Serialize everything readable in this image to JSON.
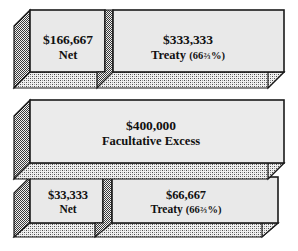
{
  "figure": {
    "name": "reinsurance-layer-diagram",
    "type": "layered-block-diagram",
    "orientation": "stacked-horizontal-bands",
    "colors": {
      "face_fill": "#e9e9e9",
      "face_fill_mid": "#ebebeb",
      "outline": "#1a1a1a",
      "extrusion_dither": "#7d7d7d",
      "shadow_dither": "#a8a8a8",
      "background": "#ffffff",
      "text": "#111111"
    }
  },
  "layers": [
    {
      "id": "top",
      "name": "top-layer",
      "blocks": [
        {
          "id": "top-net",
          "name": "top-net-block",
          "amount": "$166,667",
          "caption": "Net",
          "percent": null,
          "fraction": null
        },
        {
          "id": "top-treaty",
          "name": "top-treaty-block",
          "amount": "$333,333",
          "caption": "Treaty",
          "percent_prefix": "(66",
          "fraction": "⅔",
          "percent_suffix": "%)"
        }
      ]
    },
    {
      "id": "middle",
      "name": "middle-layer",
      "blocks": [
        {
          "id": "facultative-excess",
          "name": "facultative-excess-block",
          "amount": "$400,000",
          "caption": "Facultative Excess",
          "percent": null,
          "fraction": null
        }
      ]
    },
    {
      "id": "bottom",
      "name": "bottom-layer",
      "blocks": [
        {
          "id": "bottom-net",
          "name": "bottom-net-block",
          "amount": "$33,333",
          "caption": "Net",
          "percent": null,
          "fraction": null
        },
        {
          "id": "bottom-treaty",
          "name": "bottom-treaty-block",
          "amount": "$66,667",
          "caption": "Treaty",
          "percent_prefix": "(66",
          "fraction": "⅔",
          "percent_suffix": "%)"
        }
      ]
    }
  ],
  "text": {
    "top_net_amount": "$166,667",
    "top_net_caption": "Net",
    "top_treaty_amount": "$333,333",
    "top_treaty_caption": "Treaty",
    "top_treaty_pct_open": "(66",
    "top_treaty_frac": "⅔",
    "top_treaty_pct_close": "%)",
    "mid_amount": "$400,000",
    "mid_caption": "Facultative Excess",
    "bot_net_amount": "$33,333",
    "bot_net_caption": "Net",
    "bot_treaty_amount": "$66,667",
    "bot_treaty_caption": "Treaty",
    "bot_treaty_pct_open": "(66",
    "bot_treaty_frac": "⅔",
    "bot_treaty_pct_close": "%)"
  }
}
